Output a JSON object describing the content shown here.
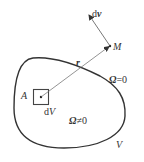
{
  "diagram": {
    "type": "vorticity-field-induction",
    "colors": {
      "stroke": "#333333",
      "thin": "#555555",
      "background": "#ffffff"
    },
    "labels": {
      "velocity": "dv",
      "velocity_d": "d",
      "velocity_v": "v",
      "point_m": "M",
      "position_vector": "r",
      "outside_region": "Ω=0",
      "outside_omega": "Ω",
      "outside_rel": "=0",
      "point_a": "A",
      "volume_element": "dV",
      "volume_d": "d",
      "volume_v": "V",
      "inside_region": "Ω≠0",
      "inside_omega": "Ω",
      "inside_rel": "≠0",
      "region_name": "V"
    },
    "elements": [
      {
        "id": "region-boundary",
        "shape": "closed-curve"
      },
      {
        "id": "volume-element-square",
        "shape": "square",
        "at": "A"
      },
      {
        "id": "position-vector",
        "from": "A",
        "to": "M"
      },
      {
        "id": "velocity-vector",
        "from": "M",
        "direction": "up-left"
      }
    ]
  }
}
